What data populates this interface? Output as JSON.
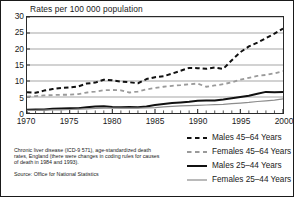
{
  "chart_data": {
    "type": "line",
    "title": "Rates per 100 000 population",
    "xlabel": "",
    "ylabel": "",
    "xlim": [
      1970,
      2000
    ],
    "ylim": [
      0,
      30
    ],
    "grid": "horizontal",
    "legend_position": "bottom-right",
    "ytick_labels": [
      "0",
      "5",
      "10",
      "15",
      "20",
      "25",
      "30"
    ],
    "ytick_values": [
      0,
      5,
      10,
      15,
      20,
      25,
      30
    ],
    "xtick_labels": [
      "1970",
      "1975",
      "1980",
      "1985",
      "1990",
      "1995",
      "2000"
    ],
    "xtick_values": [
      1970,
      1975,
      1980,
      1985,
      1990,
      1995,
      2000
    ],
    "x": [
      1970,
      1971,
      1972,
      1973,
      1974,
      1975,
      1976,
      1977,
      1978,
      1979,
      1980,
      1981,
      1982,
      1983,
      1984,
      1985,
      1986,
      1987,
      1988,
      1989,
      1990,
      1991,
      1992,
      1993,
      1994,
      1995,
      1996,
      1997,
      1998,
      1999,
      2000
    ],
    "series": [
      {
        "name": "Males 45–64 Years",
        "style": "dashed",
        "color": "#111111",
        "width": 2.0,
        "values": [
          6.5,
          6.3,
          7.0,
          7.5,
          7.8,
          8.0,
          8.3,
          9.2,
          9.5,
          10.4,
          10.2,
          9.8,
          9.6,
          9.3,
          10.6,
          11.2,
          11.5,
          12.3,
          13.2,
          14.1,
          14.0,
          13.8,
          14.2,
          13.8,
          16.5,
          19.0,
          20.8,
          22.0,
          23.4,
          24.8,
          26.4
        ]
      },
      {
        "name": "Females 45–64 Years",
        "style": "dashed",
        "color": "#9a9a9a",
        "width": 1.8,
        "values": [
          5.1,
          5.3,
          5.5,
          5.6,
          5.7,
          5.7,
          5.9,
          6.4,
          6.7,
          7.1,
          7.2,
          7.1,
          6.4,
          6.7,
          7.4,
          7.8,
          8.2,
          8.5,
          8.7,
          9.0,
          9.2,
          8.2,
          8.6,
          9.0,
          9.6,
          10.4,
          11.0,
          11.6,
          11.9,
          12.4,
          13.1
        ]
      },
      {
        "name": "Males 25–44 Years",
        "style": "solid",
        "color": "#111111",
        "width": 2.0,
        "values": [
          1.0,
          1.1,
          1.1,
          1.3,
          1.4,
          1.5,
          1.5,
          1.8,
          2.0,
          2.1,
          1.9,
          1.8,
          1.9,
          1.8,
          2.0,
          2.5,
          2.8,
          3.1,
          3.3,
          3.5,
          3.8,
          3.9,
          3.9,
          4.2,
          4.6,
          5.0,
          5.4,
          6.0,
          6.6,
          6.5,
          6.6
        ]
      },
      {
        "name": "Females 25–44 Years",
        "style": "solid",
        "color": "#8d8d8d",
        "width": 1.2,
        "values": [
          0.8,
          0.8,
          0.9,
          1.0,
          1.0,
          1.1,
          1.2,
          1.3,
          1.4,
          1.5,
          1.5,
          1.5,
          1.5,
          1.5,
          1.6,
          1.7,
          1.9,
          2.1,
          2.2,
          2.3,
          2.4,
          2.5,
          2.6,
          2.7,
          2.9,
          3.1,
          3.3,
          3.6,
          3.8,
          4.0,
          4.4
        ]
      }
    ],
    "footnote": "Chronic liver disease (ICD-9 571), age-standardized death rates, England (there were changes in coding rules for causes of death in 1984 and 1993).",
    "source": "Source: Office for National Statistics"
  }
}
